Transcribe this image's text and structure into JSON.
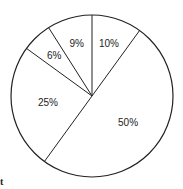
{
  "chart_data": {
    "type": "pie",
    "title": "",
    "categories": [
      "10%",
      "50%",
      "25%",
      "6%",
      "9%"
    ],
    "values": [
      10,
      50,
      25,
      6,
      9
    ],
    "labels": [
      "10%",
      "50%",
      "25%",
      "6%",
      "9%"
    ],
    "start_angle_deg": 90,
    "direction": "clockwise",
    "fill_color": "#ffffff",
    "stroke_color": "#222222",
    "legend": null
  },
  "fragment_text": "t"
}
